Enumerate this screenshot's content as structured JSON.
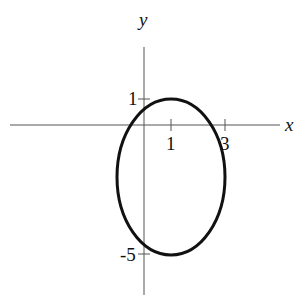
{
  "diagram": {
    "type": "ellipse-on-axes",
    "axes": {
      "x_label": "x",
      "y_label": "y",
      "x_ticks": [
        {
          "value": 1,
          "label": "1"
        },
        {
          "value": 3,
          "label": "3"
        }
      ],
      "y_ticks": [
        {
          "value": 1,
          "label": "1"
        },
        {
          "value": -5,
          "label": "-5"
        }
      ]
    },
    "ellipse": {
      "center": [
        1,
        -2
      ],
      "semi_axis_x": 2,
      "semi_axis_y": 3,
      "stroke": "#111111"
    }
  }
}
